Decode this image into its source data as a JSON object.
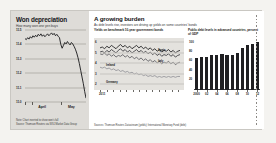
{
  "left_panel": {
    "title": "Won depreciation",
    "subtitle": "How many won one yen buys",
    "footnote_note": "Note: Chart inverted to show won's fall",
    "footnote_source": "Source: Thomson Reuters via WSJ Market Data Group"
  },
  "right_panel": {
    "title": "A growing burden",
    "subtitle": "As debt levels rise, investors are driving up yields on some countries' bonds",
    "line_head": "Yields on benchmark 10-year government bonds",
    "bar_head": "Public debt levels in advanced countries, percent of GDP",
    "source": "Sources: Thomson Reuters Datastream (yields); International Monetary Fund (debt)"
  },
  "chart_data": [
    {
      "type": "line",
      "title": "Won depreciation",
      "subtitle": "How many won one yen buys",
      "xlabel": "",
      "ylabel": "",
      "ylim": [
        10.0,
        11.5
      ],
      "yticks": [
        11.5,
        11.0,
        11.1,
        11.0,
        10.5,
        10.0
      ],
      "ytick_labels": [
        "11.5",
        "11.4",
        "11.3",
        "11.2",
        "11.1",
        "11.0"
      ],
      "xticks": [
        "April",
        "May"
      ],
      "grid": true,
      "series": [
        {
          "name": "Won per yen",
          "values": [
            11.32,
            11.3,
            11.34,
            11.31,
            11.36,
            11.33,
            11.38,
            11.35,
            11.39,
            11.36,
            11.41,
            11.38,
            11.42,
            11.37,
            11.4,
            11.36,
            11.39,
            11.42,
            11.38,
            11.41,
            11.44,
            11.4,
            11.43,
            11.38,
            11.41,
            11.37,
            11.34,
            11.2,
            11.12,
            11.18,
            11.24,
            11.21,
            11.26,
            11.22,
            11.19,
            11.24,
            11.21,
            11.16,
            11.1,
            11.02,
            10.92,
            10.8,
            10.66,
            10.52,
            10.38,
            10.22,
            10.08
          ]
        }
      ]
    },
    {
      "type": "line",
      "title": "Yields on benchmark 10-year government bonds",
      "ylabel": "",
      "ylim": [
        1,
        6
      ],
      "ytick_labels": [
        "6",
        "5",
        "4",
        "3",
        "2"
      ],
      "xtick_labels": [
        "2011",
        "",
        "",
        "",
        "",
        "",
        "",
        "",
        "",
        "",
        "",
        "",
        ""
      ],
      "grid": true,
      "annotations": [
        "Spain",
        "Italy",
        "Ireland",
        "Germany"
      ],
      "series": [
        {
          "name": "Spain",
          "values": [
            5.3,
            5.4,
            5.2,
            5.5,
            5.3,
            5.6,
            5.4,
            5.2,
            5.5,
            5.7,
            5.4,
            5.6,
            5.3,
            5.5,
            5.2,
            5.4,
            5.6,
            5.3,
            5.5,
            5.2,
            5.4,
            5.1,
            5.3,
            5.0,
            5.2,
            4.9,
            5.1,
            4.8,
            5.0,
            4.9,
            5.1,
            4.8,
            5.0,
            4.7,
            4.9,
            5.0
          ]
        },
        {
          "name": "Italy",
          "values": [
            4.8,
            4.9,
            4.7,
            5.0,
            4.8,
            5.1,
            4.9,
            4.7,
            5.0,
            5.2,
            4.9,
            5.1,
            4.8,
            5.0,
            4.7,
            4.9,
            5.1,
            4.8,
            5.0,
            4.7,
            4.9,
            4.6,
            4.8,
            4.5,
            4.7,
            4.4,
            4.6,
            4.3,
            4.5,
            4.4,
            4.6,
            4.3,
            4.5,
            4.2,
            4.4,
            4.5
          ]
        },
        {
          "name": "Ireland",
          "values": [
            4.6,
            4.5,
            4.7,
            4.4,
            4.6,
            4.3,
            4.5,
            4.2,
            4.4,
            4.3,
            4.5,
            4.2,
            4.4,
            4.1,
            4.3,
            4.0,
            4.2,
            3.9,
            4.1,
            3.8,
            4.0,
            3.7,
            3.9,
            3.6,
            3.8,
            3.5,
            3.7,
            3.4,
            3.6,
            3.5,
            3.7,
            3.4,
            3.6,
            3.3,
            3.5,
            3.6
          ]
        },
        {
          "name": "Germany",
          "values": [
            3.0,
            2.9,
            3.0,
            2.8,
            2.9,
            2.7,
            2.8,
            2.6,
            2.7,
            2.5,
            2.6,
            2.4,
            2.5,
            2.3,
            2.4,
            2.2,
            2.3,
            2.1,
            2.2,
            2.0,
            2.1,
            1.9,
            2.0,
            1.9,
            2.0,
            1.8,
            1.9,
            1.8,
            1.9,
            1.8,
            1.9,
            1.8,
            1.9,
            1.8,
            1.9,
            1.9
          ]
        }
      ]
    },
    {
      "type": "bar",
      "title": "Public debt levels in advanced countries, percent of GDP",
      "ylabel": "",
      "ylim": [
        0,
        110
      ],
      "ytick_labels": [
        "100",
        "80",
        "60",
        "40",
        "20"
      ],
      "categories": [
        "2000",
        "01",
        "02",
        "03",
        "04",
        "05",
        "06",
        "07",
        "08",
        "09",
        "10",
        "11",
        "12"
      ],
      "xtick_labels": [
        "2000",
        "02",
        "04",
        "06",
        "08",
        "10",
        "12"
      ],
      "values": [
        72,
        73,
        75,
        78,
        79,
        80,
        79,
        78,
        84,
        94,
        100,
        104,
        108
      ]
    }
  ]
}
